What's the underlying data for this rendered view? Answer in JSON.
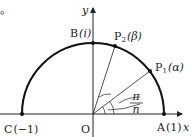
{
  "diagram": {
    "stray_mark": "。",
    "axes": {
      "x_label": "x",
      "y_label": "y"
    },
    "origin_label": "O",
    "points": {
      "A": {
        "name": "A",
        "value": "(1)"
      },
      "B": {
        "name": "B",
        "value": "(i)"
      },
      "C": {
        "name": "C",
        "value": "(−1)"
      },
      "P1": {
        "name": "P",
        "sub": "1",
        "value": "(α)"
      },
      "P2": {
        "name": "P",
        "sub": "2",
        "value": "(β)"
      }
    },
    "angle_label": {
      "numerator": "π",
      "denominator": "n"
    },
    "colors": {
      "stroke": "#222222",
      "background": "#ffffff"
    }
  }
}
